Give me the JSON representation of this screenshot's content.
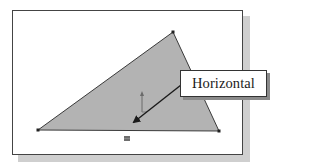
{
  "figure": {
    "type": "CAD sketch illustration",
    "frame": {
      "background": "#ffffff",
      "border_color": "#444444",
      "shadow_color": "#cfcfcf"
    },
    "triangle": {
      "fill": "#b3b3b3",
      "stroke": "#3a3a3a",
      "vertices": [
        {
          "name": "bottom-left",
          "x": 38,
          "y": 130
        },
        {
          "name": "apex",
          "x": 173,
          "y": 32
        },
        {
          "name": "bottom-right",
          "x": 219,
          "y": 131
        }
      ]
    },
    "constraint_indicator": {
      "icon": "vertical-arrow-icon",
      "x": 142,
      "y_top": 92,
      "y_bottom": 112
    },
    "origin_marker": {
      "icon": "square-marker-icon",
      "x": 124,
      "y": 136,
      "size": 6
    },
    "callout": {
      "label": "Horizontal",
      "arrow": {
        "from_x": 181,
        "from_y": 85,
        "to_x": 133,
        "to_y": 123
      }
    }
  }
}
